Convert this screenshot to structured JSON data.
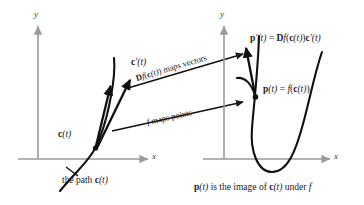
{
  "figure": {
    "colors": {
      "axis": "#9a9a9a",
      "curve": "#101010",
      "text": "#1a1a1a",
      "background": "#ffffff"
    },
    "left_panel": {
      "y_axis_label": "y",
      "x_axis_label": "x",
      "point_label": "c(t)",
      "tangent_label": "c′(t)",
      "caption": "the path c(t)"
    },
    "right_panel": {
      "y_axis_label": "y",
      "x_axis_label": "x",
      "point_label": "p(t) = f(c(t))",
      "tangent_label": "p′(t) = Df(c(t))c′(t)",
      "caption": "p(t) is the image of c(t) under f"
    },
    "arrows": {
      "vectors_label": "Df(c(t)) maps vectors",
      "points_label": "f maps points"
    },
    "math_parts": {
      "c_of_t": {
        "bold": "c",
        "rest": "(t)"
      },
      "cprime_of_t": {
        "bold": "c",
        "prime": "′",
        "rest": "(t)"
      },
      "p_of_t_lhs": {
        "bold": "p",
        "rest": "(t)"
      },
      "p_of_t_rhs_eq": " = ",
      "f_italic": "f",
      "pprime_lhs": {
        "bold": "p",
        "prime": "′",
        "rest": "(t)"
      },
      "Df_bold": "D",
      "maps_vectors_tail": ") maps vectors",
      "f_maps_points": " maps points",
      "under_f_prefix": " is the image of ",
      "under_f_suffix": " under ",
      "the_path_prefix": "the path "
    }
  }
}
